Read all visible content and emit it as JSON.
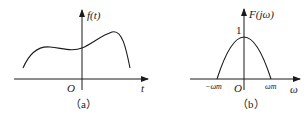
{
  "figure": {
    "panels": [
      {
        "id": "a",
        "caption": "（a）",
        "y_label": "f(t)",
        "x_label": "t",
        "origin_label": "O",
        "description": "Arbitrary smooth time-domain signal f(t)"
      },
      {
        "id": "b",
        "caption": "（b）",
        "y_label": "F(jω)",
        "x_label": "ω",
        "origin_label": "O",
        "peak_label": "1",
        "x_tick_left": "−ωm",
        "x_tick_right": "ωm",
        "description": "Band-limited spectrum F(jω), parabolic shape with peak 1 at ω=0, zero at ±ωm"
      }
    ],
    "colors": {
      "stroke": "#1a1a1a",
      "background": "#ffffff"
    }
  }
}
